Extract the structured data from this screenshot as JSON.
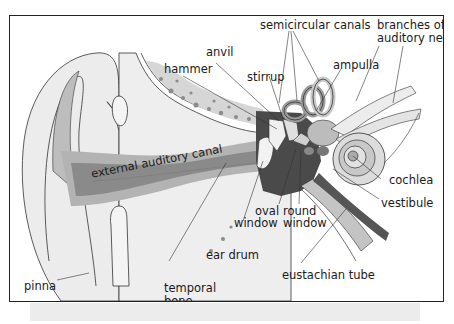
{
  "diagram": {
    "labels": {
      "semicircular_canals": "semicircular canals",
      "branches_line1": "branches of",
      "branches_line2": "auditory nerve",
      "anvil": "anvil",
      "hammer": "hammer",
      "stirrup": "stirrup",
      "ampulla": "ampulla",
      "external_auditory_canal": "external auditory canal",
      "cochlea": "cochlea",
      "vestibule": "vestibule",
      "oval_window_line1": "oval",
      "oval_window_line2": "window",
      "round_window_line1": "round",
      "round_window_line2": "window",
      "ear_drum": "ear drum",
      "pinna": "pinna",
      "temporal_bone_line1": "temporal",
      "temporal_bone_line2": "bone",
      "eustachian_tube": "eustachian tube"
    },
    "colors": {
      "frame": "#222222",
      "light_gray": "#e8e8e8",
      "mid_gray": "#b8b8b8",
      "dark_gray": "#555555",
      "canal_gray": "#8a8a8a",
      "line": "#333333"
    }
  }
}
